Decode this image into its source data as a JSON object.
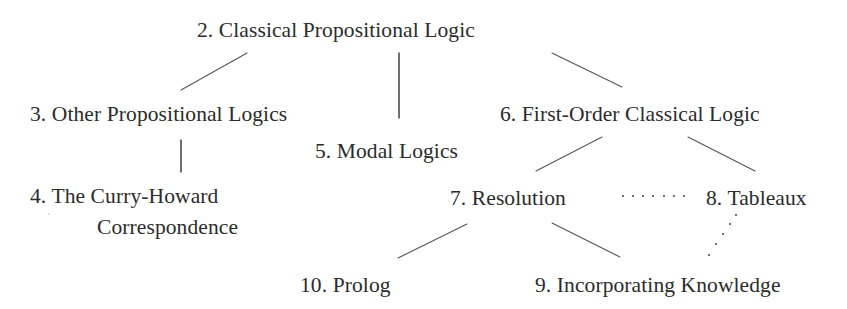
{
  "diagram": {
    "nodes": [
      {
        "id": "n2",
        "label": "2. Classical Propositional Logic"
      },
      {
        "id": "n3",
        "label": "3. Other Propositional Logics"
      },
      {
        "id": "n4",
        "label_line1": "4. The Curry-Howard",
        "label_line2": "Correspondence"
      },
      {
        "id": "n5",
        "label": "5. Modal Logics"
      },
      {
        "id": "n6",
        "label": "6. First-Order Classical Logic"
      },
      {
        "id": "n7",
        "label": "7. Resolution"
      },
      {
        "id": "n8",
        "label": "8. Tableaux"
      },
      {
        "id": "n9",
        "label": "9. Incorporating Knowledge"
      },
      {
        "id": "n10",
        "label": "10. Prolog"
      }
    ],
    "edges": [
      {
        "from": "2",
        "to": "3",
        "style": "solid"
      },
      {
        "from": "2",
        "to": "5",
        "style": "solid"
      },
      {
        "from": "2",
        "to": "6",
        "style": "solid"
      },
      {
        "from": "3",
        "to": "4",
        "style": "solid"
      },
      {
        "from": "6",
        "to": "7",
        "style": "solid"
      },
      {
        "from": "6",
        "to": "8",
        "style": "solid"
      },
      {
        "from": "7",
        "to": "10",
        "style": "solid"
      },
      {
        "from": "7",
        "to": "9",
        "style": "solid"
      },
      {
        "from": "7",
        "to": "8",
        "style": "dotted"
      },
      {
        "from": "8",
        "to": "9",
        "style": "dotted"
      }
    ],
    "colors": {
      "text": "#2b2b2b",
      "line": "#555555",
      "background": "#ffffff"
    }
  }
}
